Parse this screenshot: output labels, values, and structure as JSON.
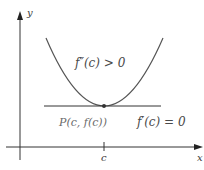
{
  "figure": {
    "x_axis_label": "x",
    "y_axis_label": "y",
    "tick_label_c": "c",
    "second_derivative_condition": "f″(c) > 0",
    "point_label": "P(c, f(c))",
    "first_derivative_condition": "f′(c) = 0"
  },
  "colors": {
    "curve": "#555555",
    "axis": "#333333",
    "tangent": "#333333",
    "text": "#4a4a4a"
  }
}
